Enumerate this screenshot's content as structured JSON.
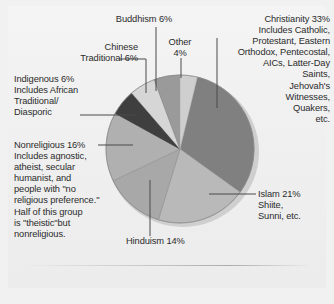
{
  "figure": {
    "background_color": "#f1f1f1",
    "sheet_color": "#f1f1f1"
  },
  "chart_data": {
    "type": "pie",
    "title": "",
    "subtitle": "",
    "xlabel": "",
    "ylabel": "",
    "legend_position": "callout-labels",
    "grid": false,
    "total_percent": 100,
    "units": "percent",
    "center": {
      "x": 180,
      "y": 149
    },
    "radius": 74,
    "start_angle_deg": -90,
    "direction": "clockwise",
    "categories": [
      "Christianity",
      "Islam",
      "Hinduism",
      "Nonreligious",
      "Indigenous",
      "Chinese Traditional",
      "Buddhism",
      "Other"
    ],
    "values": [
      33,
      21,
      14,
      16,
      6,
      6,
      6,
      4
    ],
    "colors": [
      "#808080",
      "#b9b9b9",
      "#a8a8a8",
      "#b0b0b0",
      "#3f3f3f",
      "#d6d6d6",
      "#9a9a9a",
      "#cfcfcf"
    ],
    "slices": [
      {
        "name": "Christianity",
        "value": 33,
        "color": "#808080",
        "label": "Christianity 33%"
      },
      {
        "name": "Islam",
        "value": 21,
        "color": "#b9b9b9",
        "label": "Islam 21%"
      },
      {
        "name": "Hinduism",
        "value": 14,
        "color": "#a8a8a8",
        "label": "Hinduism 14%"
      },
      {
        "name": "Nonreligious",
        "value": 16,
        "color": "#b0b0b0",
        "label": "Nonreligious 16%"
      },
      {
        "name": "Indigenous",
        "value": 6,
        "color": "#3f3f3f",
        "label": "Indigenous 6%"
      },
      {
        "name": "Chinese Traditional",
        "value": 6,
        "color": "#d6d6d6",
        "label": "Chinese Traditional 6%"
      },
      {
        "name": "Buddhism",
        "value": 6,
        "color": "#9a9a9a",
        "label": "Buddhism 6%"
      },
      {
        "name": "Other",
        "value": 4,
        "color": "#cfcfcf",
        "label": "Other 4%"
      }
    ]
  },
  "labels": {
    "christianity": "Christianity 33%\nIncludes Catholic,\nProtestant, Eastern\nOrthodox, Pentecostal,\nAICs, Latter-Day\nSaints,\nJehovah's\nWitnesses,\nQuakers,\netc.",
    "buddhism": "Buddhism 6%",
    "other": "Other\n4%",
    "chinese_traditional": "Chinese\nTraditional 6%",
    "indigenous": "Indigenous 6%\nIncludes African\nTraditional/\nDiasporic",
    "nonreligious": "Nonreligious 16%\nIncludes agnostic,\natheist, secular\nhumanist, and\npeople with \"no\nreligious preference.\"\nHalf of this group\nis \"theistic\"but\nnonreligious.",
    "islam": "Islam 21%\nShiite,\nSunni, etc.",
    "hinduism": "Hinduism 14%"
  }
}
